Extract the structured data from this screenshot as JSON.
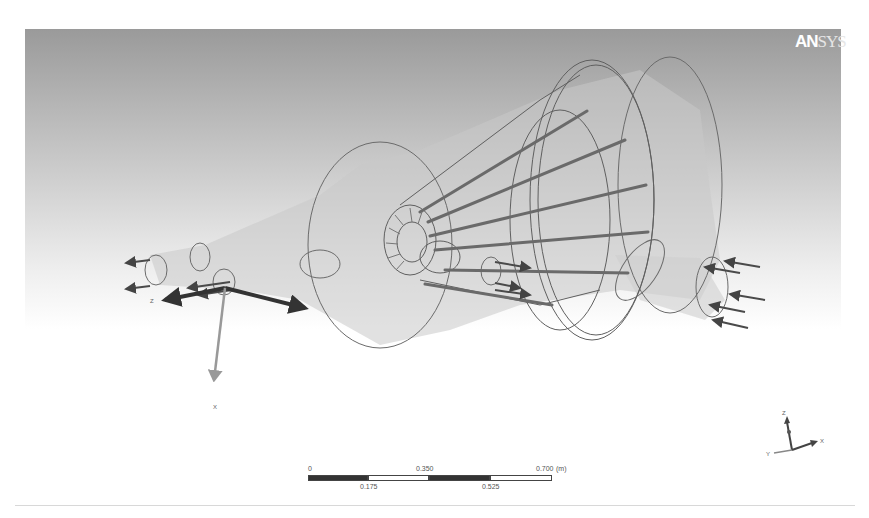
{
  "app": {
    "logo_bold": "AN",
    "logo_light": "SYS"
  },
  "viewport": {
    "background_top": "#9a9a9a",
    "background_bottom": "#ffffff",
    "geometry_line_color": "#666666",
    "arrow_color": "#444444"
  },
  "coordinate_system": {
    "local_labels": {
      "z": "Z",
      "x": "X"
    }
  },
  "triad": {
    "labels": {
      "z": "Z",
      "x": "X",
      "y": "Y"
    }
  },
  "scale_bar": {
    "top_labels": [
      "0",
      "0.350",
      "0.700"
    ],
    "bottom_labels": [
      "0.175",
      "0.525"
    ],
    "unit": "(m)"
  }
}
